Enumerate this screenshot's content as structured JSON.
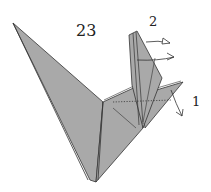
{
  "diagram": {
    "step_number": "23",
    "annotations": [
      {
        "id": "1",
        "label": "1"
      },
      {
        "id": "2",
        "label": "2"
      }
    ],
    "colors": {
      "paper": "#a9a9a9",
      "paper_dark": "#8e8e8e",
      "line": "#333333",
      "background": "#ffffff"
    }
  }
}
